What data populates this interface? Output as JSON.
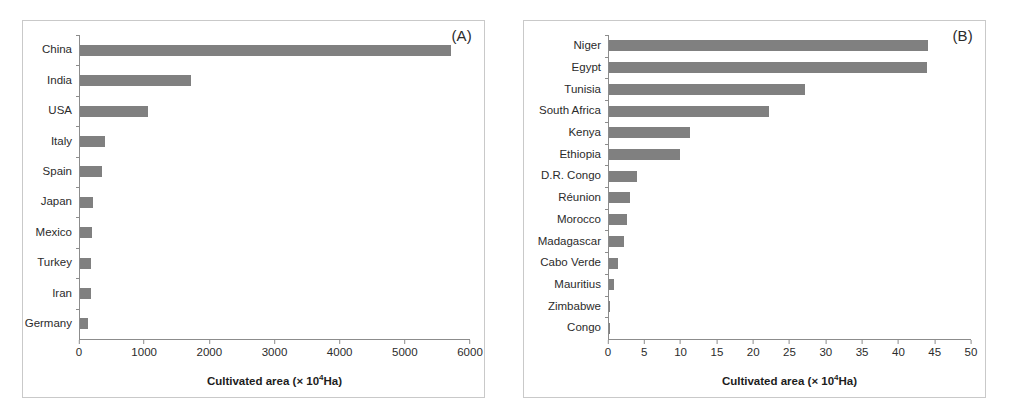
{
  "figure": {
    "background_color": "#ffffff",
    "border_color": "#c9c9c9",
    "bar_color": "#808080",
    "axis_color": "#8c8c8c"
  },
  "panels": [
    {
      "tag": "(A)",
      "axis_title_prefix": "Cultivated area (× 10",
      "axis_title_sup": "4",
      "axis_title_suffix": "Ha)",
      "label_width_px": 56,
      "chart_data": {
        "type": "bar",
        "orientation": "horizontal",
        "title": "(A)",
        "xlabel": "Cultivated area (× 10⁴Ha)",
        "ylabel": "",
        "xlim": [
          0,
          6000
        ],
        "xticks": [
          0,
          1000,
          2000,
          3000,
          4000,
          5000,
          6000
        ],
        "grid": false,
        "legend": false,
        "categories": [
          "China",
          "India",
          "USA",
          "Italy",
          "Spain",
          "Japan",
          "Mexico",
          "Turkey",
          "Iran",
          "Germany"
        ],
        "values": [
          5700,
          1700,
          1050,
          390,
          330,
          205,
          190,
          170,
          175,
          130
        ]
      }
    },
    {
      "tag": "(B)",
      "axis_title_prefix": "Cultivated area (× 10",
      "axis_title_sup": "4",
      "axis_title_suffix": "Ha)",
      "label_width_px": 84,
      "chart_data": {
        "type": "bar",
        "orientation": "horizontal",
        "title": "(B)",
        "xlabel": "Cultivated area (× 10⁴Ha)",
        "ylabel": "",
        "xlim": [
          0,
          50
        ],
        "xticks": [
          0,
          5,
          10,
          15,
          20,
          25,
          30,
          35,
          40,
          45,
          50
        ],
        "grid": false,
        "legend": false,
        "categories": [
          "Niger",
          "Egypt",
          "Tunisia",
          "South Africa",
          "Kenya",
          "Ethiopia",
          "D.R. Congo",
          "Réunion",
          "Morocco",
          "Madagascar",
          "Cabo Verde",
          "Mauritius",
          "Zimbabwe",
          "Congo"
        ],
        "values": [
          44.0,
          43.8,
          27.0,
          22.0,
          11.2,
          9.8,
          3.9,
          2.9,
          2.5,
          2.1,
          1.2,
          0.7,
          0.2,
          0.15
        ]
      }
    }
  ]
}
